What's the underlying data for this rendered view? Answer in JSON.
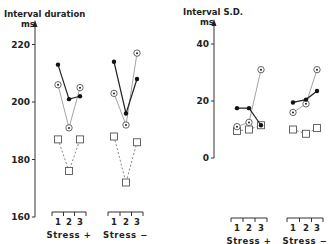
{
  "chart_data": [
    {
      "type": "line",
      "title": "",
      "ylabel": "Interval duration",
      "yunit": "ms",
      "ylim": [
        160,
        225
      ],
      "yticks": [
        160,
        180,
        200,
        220
      ],
      "groups": [
        {
          "label": "Stress +",
          "ticks": [
            "1",
            "2",
            "3"
          ]
        },
        {
          "label": "Stress −",
          "ticks": [
            "1",
            "2",
            "3"
          ]
        }
      ],
      "series": [
        {
          "name": "filled-dot",
          "marker": "filled-circle",
          "line": "solid",
          "values": [
            [
              213,
              201,
              202
            ],
            [
              214,
              196,
              208
            ]
          ]
        },
        {
          "name": "circled-dot",
          "marker": "circled-dot",
          "line": "dotted",
          "values": [
            [
              206,
              191,
              205
            ],
            [
              203,
              192,
              217
            ]
          ]
        },
        {
          "name": "square",
          "marker": "open-square",
          "line": "dashed",
          "values": [
            [
              187,
              176,
              187
            ],
            [
              188,
              172,
              186
            ]
          ]
        }
      ]
    },
    {
      "type": "line",
      "title": "",
      "ylabel": "Interval S.D.",
      "yunit": "ms",
      "ylim": [
        0,
        45
      ],
      "yticks": [
        0,
        20,
        40
      ],
      "groups": [
        {
          "label": "Stress +",
          "ticks": [
            "1",
            "2",
            "3"
          ]
        },
        {
          "label": "Stress −",
          "ticks": [
            "1",
            "2",
            "3"
          ]
        }
      ],
      "series": [
        {
          "name": "filled-dot",
          "marker": "filled-circle",
          "line": "solid",
          "values": [
            [
              17.5,
              17.5,
              11.5
            ],
            [
              19.5,
              20.5,
              23.5
            ]
          ]
        },
        {
          "name": "circled-dot",
          "marker": "circled-dot",
          "line": "dotted",
          "values": [
            [
              11,
              12.5,
              31
            ],
            [
              16,
              19,
              31
            ]
          ]
        },
        {
          "name": "square",
          "marker": "open-square",
          "line": "dashed",
          "values": [
            [
              9.5,
              10,
              11.5
            ],
            [
              10,
              8.5,
              10.5
            ]
          ]
        }
      ]
    }
  ],
  "left": {
    "ylabel": "Interval duration",
    "yunit": "ms",
    "ticks": [
      "220",
      "200",
      "180",
      "160"
    ],
    "groups": [
      "Stress +",
      "Stress −"
    ]
  },
  "right": {
    "ylabel": "Interval S.D.",
    "yunit": "ms",
    "ticks": [
      "40",
      "20",
      "0"
    ],
    "groups": [
      "Stress +",
      "Stress −"
    ]
  },
  "xticks": [
    "1",
    "2",
    "3"
  ]
}
